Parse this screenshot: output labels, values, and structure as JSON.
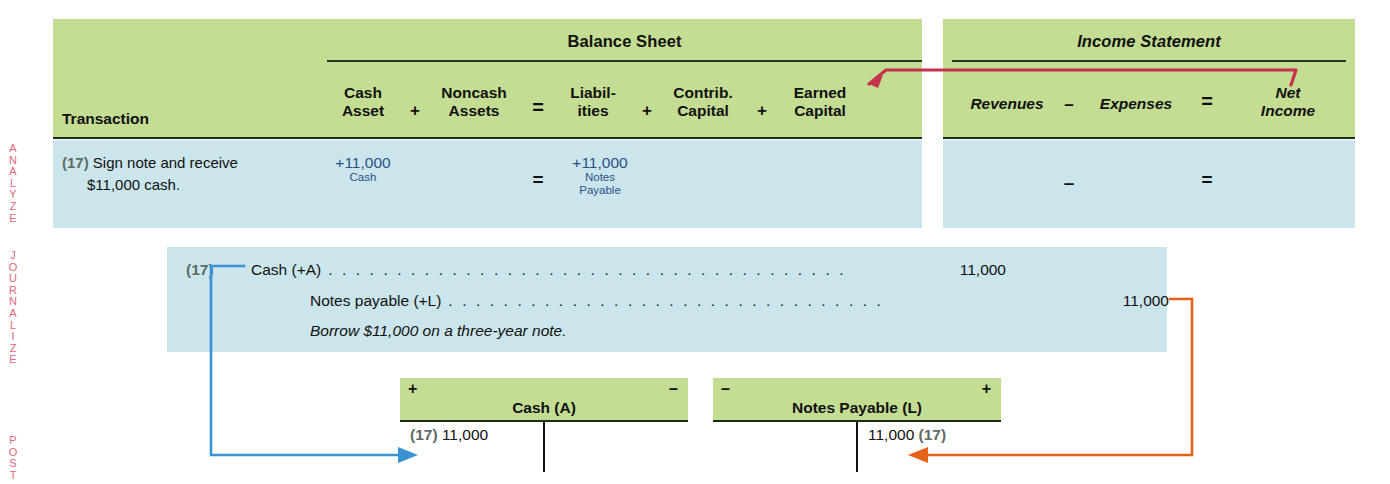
{
  "phases": [
    {
      "name": "analyze",
      "label": "ANALYZE"
    },
    {
      "name": "journalize",
      "label": "JOURNALIZE"
    },
    {
      "name": "post",
      "label": "POST"
    }
  ],
  "balance_sheet": {
    "title": "Balance Sheet",
    "transaction_header": "Transaction",
    "columns": [
      {
        "line1": "Cash",
        "line2": "Asset"
      },
      {
        "line1": "Noncash",
        "line2": "Assets"
      },
      {
        "line1": "Liabil-",
        "line2": "ities"
      },
      {
        "line1": "Contrib.",
        "line2": "Capital"
      },
      {
        "line1": "Earned",
        "line2": "Capital"
      }
    ],
    "operators": [
      "+",
      "=",
      "+",
      "+"
    ]
  },
  "income_statement": {
    "title": "Income Statement",
    "columns": [
      {
        "line1": "Revenues",
        "line2": ""
      },
      {
        "line1": "Expenses",
        "line2": ""
      },
      {
        "line1": "Net",
        "line2": "Income"
      }
    ],
    "operators": [
      "–",
      "="
    ]
  },
  "transaction": {
    "number": "(17)",
    "description_line1": "Sign note and receive",
    "description_line2": "$11,000 cash.",
    "cash_asset": {
      "amount": "+11,000",
      "account": "Cash"
    },
    "noncash_assets": {
      "amount": "",
      "account": ""
    },
    "equals_sign": "=",
    "liabilities": {
      "amount": "+11,000",
      "account": "Notes",
      "account2": "Payable"
    },
    "contrib_capital": {
      "amount": "",
      "account": ""
    },
    "earned_capital": {
      "amount": "",
      "account": ""
    },
    "revenues": "",
    "is_minus": "–",
    "expenses": "",
    "is_equals": "=",
    "net_income": ""
  },
  "journal": {
    "ref": "(17)",
    "lines": [
      {
        "account": "Cash (+A)",
        "debit": "11,000",
        "credit": ""
      },
      {
        "account": "Notes payable (+L)",
        "debit": "",
        "credit": "11,000"
      }
    ],
    "memo": "Borrow $11,000 on a three-year note."
  },
  "t_accounts": [
    {
      "name": "cash",
      "title": "Cash (A)",
      "left_sign": "+",
      "right_sign": "–",
      "debit_ref": "(17)",
      "debit_amount": "11,000",
      "credit_ref": "",
      "credit_amount": ""
    },
    {
      "name": "notes-payable",
      "title": "Notes Payable (L)",
      "left_sign": "–",
      "right_sign": "+",
      "debit_ref": "",
      "debit_amount": "",
      "credit_ref": "(17)",
      "credit_amount": "11,000"
    }
  ],
  "colors": {
    "header_green": "#c3dd92",
    "row_blue": "#cae5ec",
    "phase_label": "#e0677f",
    "amount_blue": "#2d4f86",
    "connector_blue": "#3a92d4",
    "connector_orange": "#e4621a",
    "connector_red": "#c4324b",
    "rule_dark": "#1d2a14"
  }
}
